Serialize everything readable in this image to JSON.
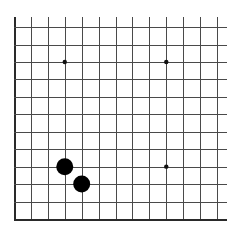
{
  "board": {
    "view": "partial-corner",
    "shown_edges": [
      "left",
      "bottom"
    ],
    "columns": 13,
    "rows": 12,
    "background": "#ffffff",
    "line_color": "#4a4a4a",
    "edge_color": "#2a2a2a",
    "geometry": {
      "x0": 14,
      "x_spacing": 16.92,
      "y_bottom": 219,
      "y_spacing": 17.45,
      "top_overhang": 10,
      "right_overhang": 10
    },
    "star_points": [
      {
        "col": 4,
        "row": 4
      },
      {
        "col": 10,
        "row": 4
      },
      {
        "col": 4,
        "row": 10
      },
      {
        "col": 10,
        "row": 10
      }
    ],
    "stones": [
      {
        "col": 4,
        "row": 4,
        "color": "black"
      },
      {
        "col": 5,
        "row": 3,
        "color": "black"
      }
    ],
    "stone_radius": 8.5,
    "star_radius": 2.2
  }
}
